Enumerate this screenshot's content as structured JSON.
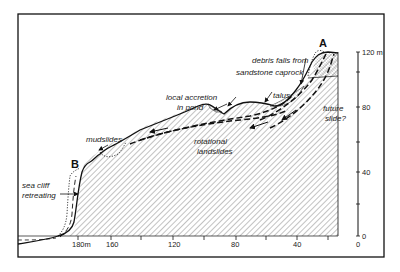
{
  "diagram": {
    "type": "geological cross-section",
    "points": {
      "A": "A",
      "B": "B"
    },
    "labels": {
      "debris_line1": "debris falls from",
      "debris_line2": "sandstone caprock",
      "talus": "talus",
      "accretion_line1": "local accretion",
      "accretion_line2": "in pond",
      "future_line1": "future",
      "future_line2": "slide?",
      "rotational_line1": "rotational",
      "rotational_line2": "landslides",
      "mudslides": "mudslides",
      "seacliff_line1": "sea cliff",
      "seacliff_line2": "retreating"
    },
    "x_axis": {
      "ticks": [
        "180m",
        "160",
        "120",
        "80",
        "40",
        "0"
      ]
    },
    "y_axis": {
      "ticks": [
        "120 m",
        "80",
        "40",
        "0"
      ]
    },
    "colors": {
      "line": "#111111",
      "hatch": "#555555",
      "frame": "#111111"
    }
  }
}
